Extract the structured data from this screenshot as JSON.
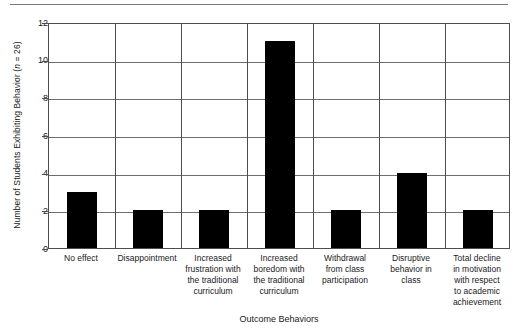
{
  "chart_data": {
    "type": "bar",
    "title": "",
    "subtitle": "",
    "xlabel": "Outcome Behaviors",
    "ylabel": "Number of Students Exhibiting Behavior (n = 26)",
    "ylabel_prefix": "Number of Students Exhibiting Behavior (",
    "ylabel_italic": "n",
    "ylabel_suffix": " = 26)",
    "categories": [
      "No effect",
      "Disappointment",
      "Increased frustration with the traditional curriculum",
      "Increased boredom with the traditional curriculum",
      "Withdrawal from class participation",
      "Disruptive behavior in class",
      "Total decline in motivation with respect to academic achievement"
    ],
    "category_lines": [
      [
        "No effect"
      ],
      [
        "Disappointment"
      ],
      [
        "Increased",
        "frustration with",
        "the traditional",
        "curriculum"
      ],
      [
        "Increased",
        "boredom with",
        "the traditional",
        "curriculum"
      ],
      [
        "Withdrawal",
        "from class",
        "participation"
      ],
      [
        "Disruptive",
        "behavior in",
        "class"
      ],
      [
        "Total decline",
        "in motivation",
        "with respect",
        "to academic",
        "achievement"
      ]
    ],
    "values": [
      3,
      2,
      2,
      11,
      2,
      4,
      2
    ],
    "ylim": [
      0,
      12
    ],
    "ytick_labels": [
      "0",
      "2",
      "4",
      "6",
      "8",
      "10",
      "12"
    ],
    "ytick_values": [
      0,
      2,
      4,
      6,
      8,
      10,
      12
    ],
    "grid": true,
    "legend": "none",
    "bar_color": "#000000",
    "grid_color": "#6e6e6e",
    "axis_color": "#4d4d4d",
    "text_color": "#1a1a1a"
  }
}
